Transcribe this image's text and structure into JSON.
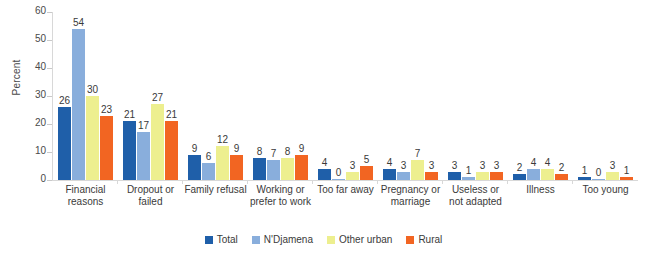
{
  "chart_data": {
    "type": "bar",
    "title": "",
    "xlabel": "",
    "ylabel": "Percent",
    "ylim": [
      0,
      60
    ],
    "yticks": [
      0,
      10,
      20,
      30,
      40,
      50,
      60
    ],
    "grid": false,
    "legend_position": "bottom",
    "categories": [
      "Financial reasons",
      "Dropout or failed",
      "Family refusal",
      "Working or prefer to work",
      "Too far away",
      "Pregnancy or marriage",
      "Useless or not adapted",
      "Illness",
      "Too young"
    ],
    "series": [
      {
        "name": "Total",
        "color": "#1F5FA9",
        "values": [
          26,
          21,
          9,
          8,
          4,
          4,
          3,
          2,
          1
        ]
      },
      {
        "name": "N'Djamena",
        "color": "#89AEDC",
        "values": [
          54,
          17,
          6,
          7,
          0,
          3,
          1,
          4,
          0
        ]
      },
      {
        "name": "Other urban",
        "color": "#EDEF8F",
        "values": [
          30,
          27,
          12,
          8,
          3,
          7,
          3,
          4,
          3
        ]
      },
      {
        "name": "Rural",
        "color": "#F26522",
        "values": [
          23,
          21,
          9,
          9,
          5,
          3,
          3,
          2,
          1
        ]
      }
    ]
  }
}
